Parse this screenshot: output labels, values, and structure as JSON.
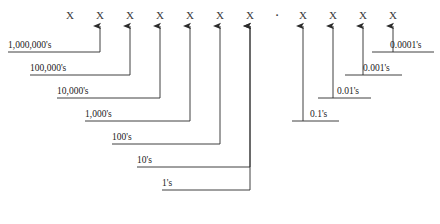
{
  "diagram": {
    "digit_symbol": "X",
    "decimal_point": "·",
    "digits": [
      {
        "symbol": "X",
        "x": 70,
        "place": "1,000,000's"
      },
      {
        "symbol": "X",
        "x": 100,
        "place": "100,000's"
      },
      {
        "symbol": "X",
        "x": 130,
        "place": "10,000's"
      },
      {
        "symbol": "X",
        "x": 160,
        "place": "1,000's"
      },
      {
        "symbol": "X",
        "x": 190,
        "place": "100's"
      },
      {
        "symbol": "X",
        "x": 220,
        "place": "10's"
      },
      {
        "symbol": "X",
        "x": 250,
        "place": "1's"
      },
      {
        "symbol": "X",
        "x": 303,
        "place": "0.1's"
      },
      {
        "symbol": "X",
        "x": 333,
        "place": "0.01's"
      },
      {
        "symbol": "X",
        "x": 363,
        "place": "0.001's"
      },
      {
        "symbol": "X",
        "x": 393,
        "place": "0.0001's"
      }
    ],
    "decimal_x": 277,
    "labels_left": [
      {
        "text": "1,000,000's",
        "text_x": 8,
        "text_y": 40,
        "line_y": 52,
        "line_x2": 100,
        "stem_x": 100
      },
      {
        "text": "100,000's",
        "text_x": 30,
        "text_y": 63,
        "line_y": 75,
        "line_x2": 130,
        "stem_x": 130
      },
      {
        "text": "10,000's",
        "text_x": 57,
        "text_y": 86,
        "line_y": 98,
        "line_x2": 160,
        "stem_x": 160
      },
      {
        "text": "1,000's",
        "text_x": 85,
        "text_y": 109,
        "line_y": 121,
        "line_x2": 190,
        "stem_x": 190
      },
      {
        "text": "100's",
        "text_x": 112,
        "text_y": 132,
        "line_y": 144,
        "line_x2": 220,
        "stem_x": 220
      },
      {
        "text": "10's",
        "text_x": 137,
        "text_y": 155,
        "line_y": 167,
        "line_x2": 250,
        "stem_x": 250
      },
      {
        "text": "1's",
        "text_x": 162,
        "text_y": 178,
        "line_y": 190,
        "line_x2": 250,
        "stem_x": 250
      }
    ],
    "labels_right": [
      {
        "text": "0.0001's",
        "text_x": 390,
        "text_y": 40,
        "line_y": 52,
        "line_x1": 372,
        "stem_x": 393
      },
      {
        "text": "0.001's",
        "text_x": 363,
        "text_y": 63,
        "line_y": 75,
        "line_x1": 345,
        "stem_x": 363
      },
      {
        "text": "0.01's",
        "text_x": 337,
        "text_y": 86,
        "line_y": 98,
        "line_x1": 318,
        "stem_x": 333
      },
      {
        "text": "0.1's",
        "text_x": 310,
        "text_y": 109,
        "line_y": 121,
        "line_x1": 292,
        "stem_x": 303
      }
    ],
    "geometry": {
      "digit_baseline_y": 16,
      "arrow_tip_y": 26,
      "stroke_color": "#2b2b2b",
      "stroke_width": 0.9
    }
  }
}
